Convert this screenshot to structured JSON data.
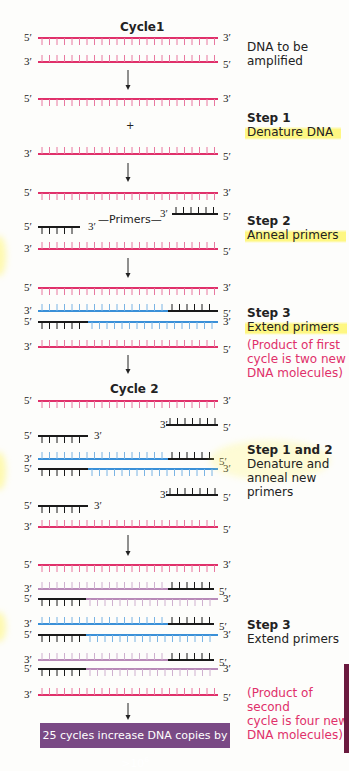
{
  "colors": {
    "template": "#e0306a",
    "new_strand_1": "#3a90d8",
    "new_strand_2": "#b88ab8",
    "primer": "#1a1a1a",
    "summary_bg": "#7a4a85",
    "note": "#e0306a",
    "highlight": "#fff55a"
  },
  "cycles": [
    {
      "label": "Cycle1",
      "x": 120,
      "y": 20
    },
    {
      "label": "Cycle 2",
      "x": 110,
      "y": 382
    }
  ],
  "strands": [
    {
      "y": 38,
      "dir": "down",
      "left": "5′",
      "right": "3′",
      "segments": [
        {
          "x1": 38,
          "x2": 218,
          "color": "template"
        }
      ]
    },
    {
      "y": 62,
      "dir": "up",
      "left": "3′",
      "right": "5′",
      "segments": [
        {
          "x1": 38,
          "x2": 218,
          "color": "template"
        }
      ]
    },
    {
      "y": 99,
      "dir": "down",
      "left": "5′",
      "right": "3′",
      "segments": [
        {
          "x1": 38,
          "x2": 218,
          "color": "template"
        }
      ]
    },
    {
      "y": 154,
      "dir": "up",
      "left": "3′",
      "right": "5′",
      "segments": [
        {
          "x1": 38,
          "x2": 218,
          "color": "template"
        }
      ]
    },
    {
      "y": 193,
      "dir": "down",
      "left": "5′",
      "right": "3′",
      "segments": [
        {
          "x1": 38,
          "x2": 218,
          "color": "template"
        }
      ]
    },
    {
      "y": 214,
      "dir": "up",
      "left": "3′",
      "right": "5′",
      "leftX": 160,
      "segments": [
        {
          "x1": 172,
          "x2": 218,
          "color": "primer"
        }
      ]
    },
    {
      "y": 227,
      "dir": "down",
      "left": "5′",
      "right": "3′",
      "rightX": 88,
      "segments": [
        {
          "x1": 38,
          "x2": 80,
          "color": "primer"
        }
      ]
    },
    {
      "y": 249,
      "dir": "up",
      "left": "3′",
      "right": "5′",
      "segments": [
        {
          "x1": 38,
          "x2": 218,
          "color": "template"
        }
      ]
    },
    {
      "y": 288,
      "dir": "down",
      "left": "5′",
      "right": "3′",
      "segments": [
        {
          "x1": 38,
          "x2": 218,
          "color": "template"
        }
      ]
    },
    {
      "y": 311,
      "dir": "up",
      "left": "3′",
      "right": "5′",
      "segments": [
        {
          "x1": 38,
          "x2": 168,
          "color": "new_strand_1"
        },
        {
          "x1": 168,
          "x2": 218,
          "color": "primer"
        }
      ]
    },
    {
      "y": 322,
      "dir": "down",
      "left": "5′",
      "right": "3′",
      "segments": [
        {
          "x1": 38,
          "x2": 88,
          "color": "primer"
        },
        {
          "x1": 88,
          "x2": 218,
          "color": "new_strand_1"
        }
      ]
    },
    {
      "y": 347,
      "dir": "up",
      "left": "3′",
      "right": "5′",
      "segments": [
        {
          "x1": 38,
          "x2": 218,
          "color": "template"
        }
      ]
    },
    {
      "y": 401,
      "dir": "down",
      "left": "5′",
      "right": "3′",
      "segments": [
        {
          "x1": 38,
          "x2": 218,
          "color": "template"
        }
      ]
    },
    {
      "y": 425,
      "dir": "up",
      "left": "3′",
      "right": "5′",
      "leftX": 160,
      "segments": [
        {
          "x1": 166,
          "x2": 218,
          "color": "primer"
        }
      ]
    },
    {
      "y": 436,
      "dir": "down",
      "left": "5′",
      "right": "3′",
      "rightX": 94,
      "segments": [
        {
          "x1": 38,
          "x2": 88,
          "color": "primer"
        }
      ]
    },
    {
      "y": 459,
      "dir": "up",
      "left": "3′",
      "right": "5′",
      "segments": [
        {
          "x1": 38,
          "x2": 168,
          "color": "new_strand_1"
        },
        {
          "x1": 168,
          "x2": 214,
          "color": "primer"
        }
      ]
    },
    {
      "y": 469,
      "dir": "down",
      "left": "5′",
      "right": "3′",
      "segments": [
        {
          "x1": 38,
          "x2": 88,
          "color": "primer"
        },
        {
          "x1": 88,
          "x2": 218,
          "color": "new_strand_1"
        }
      ]
    },
    {
      "y": 495,
      "dir": "up",
      "left": "3′",
      "right": "5′",
      "leftX": 160,
      "segments": [
        {
          "x1": 166,
          "x2": 218,
          "color": "primer"
        }
      ]
    },
    {
      "y": 506,
      "dir": "down",
      "left": "5′",
      "right": "3′",
      "rightX": 94,
      "segments": [
        {
          "x1": 38,
          "x2": 88,
          "color": "primer"
        }
      ]
    },
    {
      "y": 527,
      "dir": "up",
      "left": "3′",
      "right": "5′",
      "segments": [
        {
          "x1": 38,
          "x2": 218,
          "color": "template"
        }
      ]
    },
    {
      "y": 565,
      "dir": "down",
      "left": "5′",
      "right": "3′",
      "segments": [
        {
          "x1": 38,
          "x2": 218,
          "color": "template"
        }
      ]
    },
    {
      "y": 589,
      "dir": "up",
      "left": "3′",
      "right": "5′",
      "segments": [
        {
          "x1": 38,
          "x2": 168,
          "color": "new_strand_2"
        },
        {
          "x1": 168,
          "x2": 214,
          "color": "primer"
        }
      ]
    },
    {
      "y": 599,
      "dir": "down",
      "left": "5′",
      "right": "3′",
      "segments": [
        {
          "x1": 38,
          "x2": 86,
          "color": "primer"
        },
        {
          "x1": 86,
          "x2": 218,
          "color": "new_strand_2"
        }
      ]
    },
    {
      "y": 624,
      "dir": "up",
      "left": "3′",
      "right": "5′",
      "segments": [
        {
          "x1": 38,
          "x2": 168,
          "color": "new_strand_1"
        },
        {
          "x1": 168,
          "x2": 214,
          "color": "primer"
        }
      ]
    },
    {
      "y": 635,
      "dir": "down",
      "left": "5′",
      "right": "3′",
      "segments": [
        {
          "x1": 38,
          "x2": 86,
          "color": "primer"
        },
        {
          "x1": 86,
          "x2": 218,
          "color": "new_strand_1"
        }
      ]
    },
    {
      "y": 660,
      "dir": "up",
      "left": "3′",
      "right": "5′",
      "segments": [
        {
          "x1": 38,
          "x2": 168,
          "color": "new_strand_2"
        },
        {
          "x1": 168,
          "x2": 214,
          "color": "primer"
        }
      ]
    },
    {
      "y": 669,
      "dir": "down",
      "left": "5′",
      "right": "3′",
      "segments": [
        {
          "x1": 38,
          "x2": 86,
          "color": "primer"
        },
        {
          "x1": 86,
          "x2": 218,
          "color": "new_strand_2"
        }
      ]
    },
    {
      "y": 695,
      "dir": "up",
      "left": "3′",
      "right": "5′",
      "segments": [
        {
          "x1": 38,
          "x2": 218,
          "color": "template"
        }
      ]
    }
  ],
  "arrows": [
    {
      "x": 128,
      "y1": 70,
      "y2": 90
    },
    {
      "x": 128,
      "y1": 163,
      "y2": 182
    },
    {
      "x": 128,
      "y1": 258,
      "y2": 278
    },
    {
      "x": 128,
      "y1": 355,
      "y2": 374
    },
    {
      "x": 128,
      "y1": 535,
      "y2": 556
    },
    {
      "x": 128,
      "y1": 703,
      "y2": 720
    }
  ],
  "plus": {
    "text": "+",
    "x": 125,
    "y": 121
  },
  "primers_label": {
    "text": "Primers",
    "x": 115,
    "y": 213
  },
  "labels": {
    "dna_to_amplify": {
      "line1": "DNA to be",
      "line2": "amplified"
    },
    "step1": {
      "title": "Step 1",
      "desc": "Denature DNA"
    },
    "step2": {
      "title": "Step 2",
      "desc": "Anneal primers"
    },
    "step3_c1": {
      "title": "Step 3",
      "desc": "Extend primers"
    },
    "note_c1": {
      "line1": "(Product of first",
      "line2": "cycle is two new",
      "line3": "DNA molecules)"
    },
    "step12_c2": {
      "title": "Step 1 and 2",
      "line1": "Denature and",
      "line2": "anneal new",
      "line3": "primers"
    },
    "step3_c2": {
      "title": "Step 3",
      "desc": "Extend primers"
    },
    "note_c2": {
      "line1": "(Product of second",
      "line2": "cycle is four new",
      "line3": "DNA molecules)"
    }
  },
  "summary": {
    "text": "25 cycles increase DNA copies by >10",
    "exponent": "6"
  }
}
